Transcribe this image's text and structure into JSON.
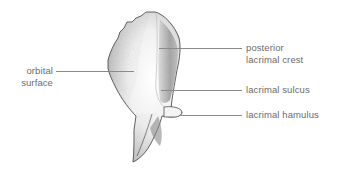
{
  "figure": {
    "colors": {
      "background": "#ffffff",
      "text": "#6b6b6b",
      "leader": "#8a8a8a",
      "outline": "#3a3a3a",
      "shade": "#9a9a9a"
    }
  },
  "labels": {
    "orbital_surface": {
      "line1": "orbital",
      "line2": "surface"
    },
    "posterior_lacrimal_crest": {
      "line1": "posterior",
      "line2": "lacrimal crest"
    },
    "lacrimal_sulcus": {
      "line1": "lacrimal sulcus"
    },
    "lacrimal_hamulus": {
      "line1": "lacrimal hamulus"
    }
  }
}
